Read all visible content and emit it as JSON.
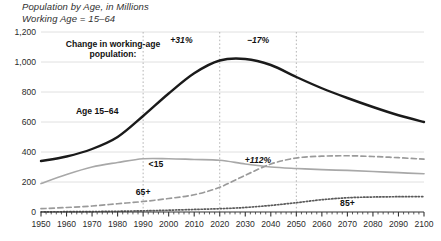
{
  "header": {
    "title": "Population by Age, in Millions",
    "subtitle": "Working Age = 15–64"
  },
  "callout": {
    "line1": "Change in working-age",
    "line2": "population:"
  },
  "chart_data": {
    "type": "line",
    "title": "Population by Age, in Millions",
    "subtitle": "Working Age = 15–64",
    "xlabel": "",
    "ylabel": "",
    "xlim": [
      1950,
      2100
    ],
    "ylim": [
      0,
      1200
    ],
    "grid": true,
    "legend_position": "inline-labels",
    "xticks": [
      1950,
      1960,
      1970,
      1980,
      1990,
      2000,
      2010,
      2020,
      2030,
      2040,
      2050,
      2060,
      2070,
      2080,
      2090,
      2100
    ],
    "xtick_labels": [
      "1950",
      "1960",
      "1970",
      "1980",
      "1990",
      "2000",
      "2010",
      "2020",
      "2030",
      "2040",
      "2050",
      "2060",
      "2070",
      "2080",
      "2090",
      "2100"
    ],
    "xminor_interval": 2,
    "yticks": [
      0,
      200,
      400,
      600,
      800,
      1000,
      1200
    ],
    "ytick_labels": [
      "0",
      "200",
      "400",
      "600",
      "800",
      "1,000",
      "1,200"
    ],
    "x": [
      1950,
      1960,
      1970,
      1980,
      1990,
      2000,
      2010,
      2020,
      2030,
      2040,
      2050,
      2060,
      2070,
      2080,
      2090,
      2100
    ],
    "series": [
      {
        "name": "Age 15–64",
        "label": "Age 15–64",
        "style": "solid",
        "color": "#1a1a1a",
        "width": 2.4,
        "values": [
          340,
          370,
          420,
          500,
          640,
          790,
          925,
          1010,
          1020,
          980,
          900,
          825,
          760,
          700,
          645,
          600
        ]
      },
      {
        "name": "<15",
        "label": "<15",
        "style": "solid",
        "color": "#a8a8a8",
        "width": 1.7,
        "values": [
          190,
          250,
          300,
          330,
          355,
          355,
          350,
          345,
          320,
          300,
          290,
          283,
          277,
          270,
          262,
          255
        ]
      },
      {
        "name": "65+",
        "label": "65+",
        "style": "dashed",
        "color": "#9a9a9a",
        "width": 1.7,
        "values": [
          22,
          30,
          40,
          55,
          70,
          90,
          115,
          165,
          245,
          320,
          360,
          372,
          375,
          370,
          362,
          352
        ]
      },
      {
        "name": "85+",
        "label": "85+",
        "style": "dotted",
        "color": "#5a5a5a",
        "width": 1.7,
        "values": [
          1,
          2,
          3,
          5,
          8,
          12,
          17,
          22,
          30,
          44,
          62,
          82,
          95,
          100,
          102,
          103
        ]
      }
    ],
    "vertical_markers": [
      {
        "x": 1990,
        "style": "dotted"
      },
      {
        "x": 2020,
        "style": "dotted"
      },
      {
        "x": 2050,
        "style": "dotted"
      }
    ],
    "annotations": [
      {
        "text": "+31%",
        "x": 2005,
        "y": 1130,
        "series": "Age 15–64",
        "span": [
          1990,
          2020
        ]
      },
      {
        "text": "−17%",
        "x": 2035,
        "y": 1130,
        "series": "Age 15–64",
        "span": [
          2020,
          2050
        ]
      },
      {
        "text": "+112%",
        "x": 2035,
        "y": 330,
        "series": "65+",
        "span": [
          2020,
          2050
        ]
      }
    ],
    "series_labels": [
      {
        "text": "Age 15–64",
        "x": 1972,
        "y": 655
      },
      {
        "text": "<15",
        "x": 1995,
        "y": 298
      },
      {
        "text": "65+",
        "x": 1990,
        "y": 113
      },
      {
        "text": "85+",
        "x": 2070,
        "y": 42
      }
    ]
  }
}
